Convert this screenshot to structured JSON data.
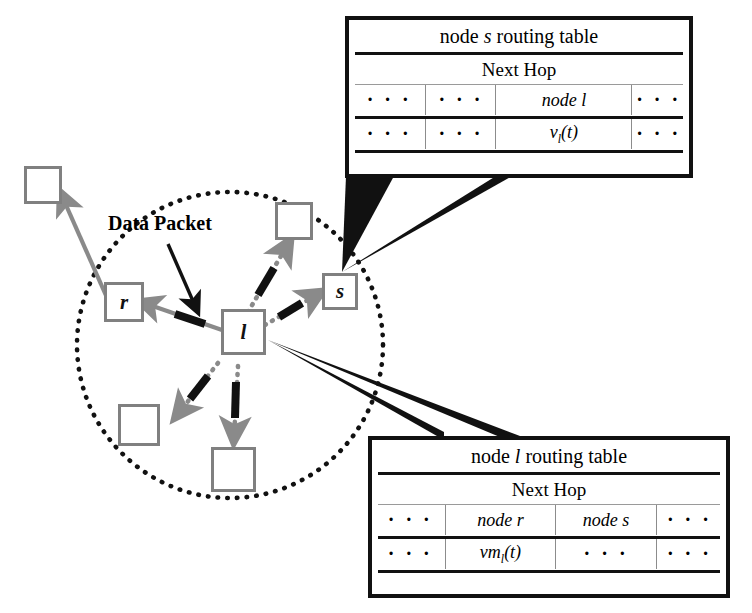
{
  "figure": {
    "caption_label": "Data Packet"
  },
  "colors": {
    "node_border": "#808080",
    "table_border": "#111111",
    "link_gray": "#808080",
    "packet_black": "#111111",
    "circle_dotted": "#111111"
  },
  "network": {
    "center_node": {
      "name": "node-l",
      "label": "l"
    },
    "nodes": [
      {
        "name": "node-r",
        "label": "r"
      },
      {
        "name": "node-s",
        "label": "s"
      },
      {
        "name": "node-outer-top-left",
        "label": ""
      },
      {
        "name": "node-inner-top",
        "label": ""
      },
      {
        "name": "node-inner-bottom-left",
        "label": ""
      },
      {
        "name": "node-inner-bottom",
        "label": ""
      }
    ]
  },
  "tables": [
    {
      "name": "node-s-routing-table",
      "title_prefix": "node ",
      "title_var": "s",
      "title_suffix": " routing table",
      "subheader": "Next Hop",
      "columns": 4,
      "rows": [
        {
          "cells": [
            "· · ·",
            "· · ·",
            "node l",
            "· · ·"
          ],
          "styles": [
            "dots",
            "dots",
            "ital",
            "dots"
          ]
        },
        {
          "cells": [
            "· · ·",
            "· · ·",
            "v_l(t)",
            "· · ·"
          ],
          "styles": [
            "dots",
            "dots",
            "formula",
            "dots"
          ]
        }
      ],
      "formula": {
        "base": "v",
        "sub": "l",
        "arg": "(t)"
      }
    },
    {
      "name": "node-l-routing-table",
      "title_prefix": "node ",
      "title_var": "l",
      "title_suffix": " routing table",
      "subheader": "Next Hop",
      "columns": 4,
      "rows": [
        {
          "cells": [
            "· · ·",
            "node r",
            "node s",
            "· · ·"
          ],
          "styles": [
            "dots",
            "ital",
            "ital",
            "dots"
          ]
        },
        {
          "cells": [
            "· · ·",
            "vm_l(t)",
            "· · ·",
            "· · ·"
          ],
          "styles": [
            "dots",
            "formula",
            "dots",
            "dots"
          ]
        }
      ],
      "formula": {
        "base": "vm",
        "sub": "l",
        "arg": "(t)"
      }
    }
  ]
}
